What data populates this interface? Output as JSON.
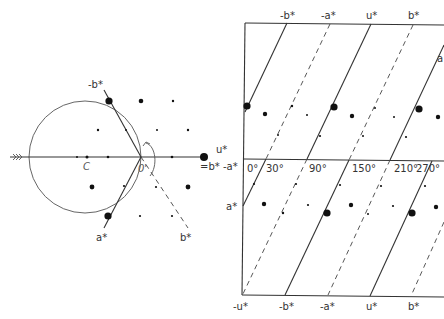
{
  "left_diagram": {
    "labels": {
      "minus_b_star": "-b*",
      "u_star": "u*",
      "eq_b_minus_a": "=b* -a*",
      "center": "C",
      "origin": "0'",
      "a_star": "a*",
      "b_star": "b*"
    }
  },
  "right_diagram": {
    "top_labels": [
      "-b*",
      "-a*",
      "u*",
      "b*",
      "a"
    ],
    "bottom_labels": [
      "-u*",
      "-b*",
      "-a*",
      "u*",
      "b*"
    ],
    "left_labels": {
      "u_star": "u*",
      "eq": "=b* -a*",
      "a_star": "a*"
    },
    "angle_labels": [
      "0°",
      "30°",
      "90°",
      "150°",
      "210°",
      "270°"
    ]
  }
}
